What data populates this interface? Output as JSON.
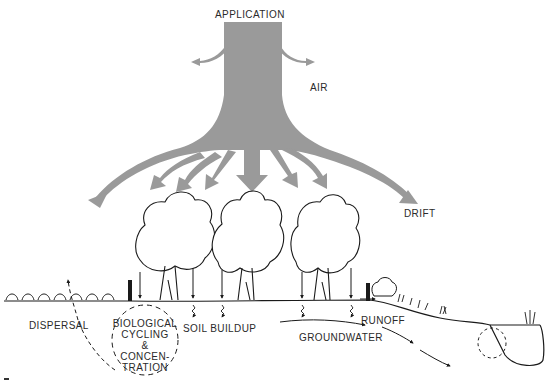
{
  "diagram": {
    "colors": {
      "flow_arrows": "#999999",
      "line_art": "#1a1a1a",
      "background": "#ffffff",
      "labels": "#2a2a2a"
    },
    "labels": {
      "application": "APPLICATION",
      "air": "AIR",
      "drift": "DRIFT",
      "dispersal": "DISPERSAL",
      "biological_line1": "BIOLOGICAL",
      "biological_line2": "CYCLING",
      "biological_line3": "&",
      "biological_line4": "CONCEN-",
      "biological_line5": "TRATION",
      "soil_buildup": "SOIL BUILDUP",
      "runoff": "RUNOFF",
      "groundwater": "GROUNDWATER"
    },
    "icons": [
      "application-flow-arrow-icon",
      "air-arrow-icon",
      "drift-arrow-icon",
      "tree-icon",
      "shrub-icon",
      "fence-post-icon",
      "pond-icon",
      "cycle-arrows-icon"
    ]
  }
}
